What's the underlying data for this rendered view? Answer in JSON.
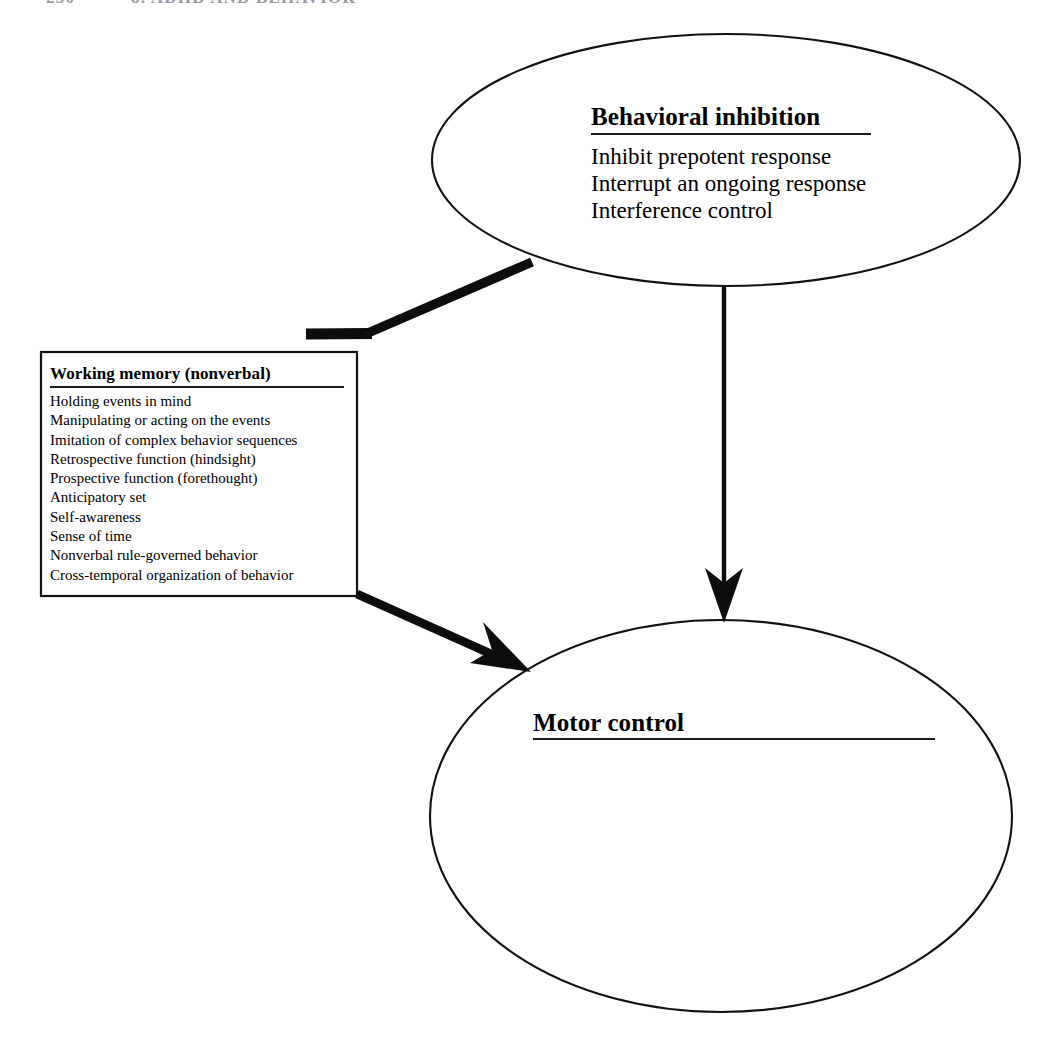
{
  "page": {
    "width": 1049,
    "height": 1053,
    "background_color": "#ffffff",
    "ink_color": "#000000"
  },
  "running_head": {
    "page_number": "230",
    "chapter_label": "8. ADHD AND BEHAVIOR",
    "note": "clipped at top edge, largely illegible"
  },
  "diagram": {
    "type": "flow-diagram",
    "nodes": [
      {
        "id": "behavioral-inhibition",
        "shape": "ellipse",
        "title": "Behavioral inhibition",
        "items": [
          "Inhibit prepotent response",
          "Interrupt an ongoing response",
          "Interference control"
        ],
        "geometry": {
          "cx": 726,
          "cy": 160,
          "rx": 294,
          "ry": 126
        }
      },
      {
        "id": "working-memory-nonverbal",
        "shape": "rectangle",
        "title": "Working memory (nonverbal)",
        "items": [
          "Holding events in mind",
          "Manipulating or acting on the events",
          "Imitation of complex behavior sequences",
          "Retrospective function (hindsight)",
          "Prospective function (forethought)",
          "Anticipatory set",
          "Self-awareness",
          "Sense of time",
          "Nonverbal rule-governed behavior",
          "Cross-temporal organization of behavior"
        ],
        "geometry": {
          "x": 41,
          "y": 352,
          "width": 316,
          "height": 244
        }
      },
      {
        "id": "motor-control",
        "shape": "ellipse",
        "title": "Motor control",
        "items": [],
        "geometry": {
          "cx": 721,
          "cy": 816,
          "rx": 291,
          "ry": 196
        }
      }
    ],
    "connectors": [
      {
        "id": "inhibition-to-working-memory",
        "from": "behavioral-inhibition",
        "to": "working-memory-nonverbal",
        "terminator": "blunt-bar",
        "style": "thick-elbow"
      },
      {
        "id": "inhibition-to-motor-control",
        "from": "behavioral-inhibition",
        "to": "motor-control",
        "terminator": "arrowhead",
        "style": "vertical-line"
      },
      {
        "id": "working-memory-to-motor-control",
        "from": "working-memory-nonverbal",
        "to": "motor-control",
        "terminator": "arrowhead",
        "style": "thick-diagonal"
      }
    ]
  }
}
